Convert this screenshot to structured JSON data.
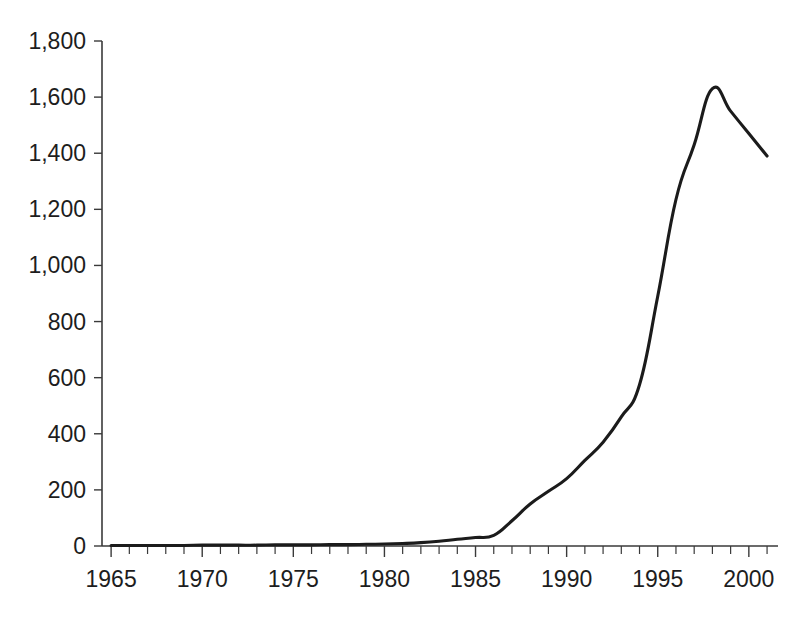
{
  "chart_data": {
    "type": "line",
    "title": "",
    "subtitle": "",
    "xlabel": "",
    "ylabel": "",
    "xlim": [
      1964.5,
      2001.6
    ],
    "ylim": [
      0,
      1800
    ],
    "grid": false,
    "legend": null,
    "legend_position": "none",
    "y_tick_labels": [
      "1,800",
      "1,600",
      "1,400",
      "1,200",
      "1,000",
      "800",
      "600",
      "400",
      "200",
      "0"
    ],
    "y_tick_values": [
      1800,
      1600,
      1400,
      1200,
      1000,
      800,
      600,
      400,
      200,
      0
    ],
    "y_tick_step": 200,
    "x_tick_labels": [
      "1965",
      "1970",
      "1975",
      "1980",
      "1985",
      "1990",
      "1995",
      "2000"
    ],
    "x_tick_values": [
      1965,
      1970,
      1975,
      1980,
      1985,
      1990,
      1995,
      2000
    ],
    "x_minor_tick_step": 1,
    "series": [
      {
        "name": "series-1",
        "color": "#1b1b1b",
        "x": [
          1965,
          1966,
          1967,
          1968,
          1969,
          1970,
          1971,
          1972,
          1973,
          1974,
          1975,
          1976,
          1977,
          1978,
          1979,
          1980,
          1981,
          1982,
          1983,
          1984,
          1985,
          1986,
          1987,
          1988,
          1989,
          1990,
          1991,
          1992,
          1993,
          1994,
          1995,
          1996,
          1997,
          1998,
          1999,
          2000,
          2001
        ],
        "values": [
          2,
          2,
          2,
          2,
          2,
          3,
          3,
          3,
          3,
          4,
          4,
          4,
          5,
          5,
          6,
          7,
          9,
          12,
          17,
          24,
          30,
          38,
          90,
          150,
          195,
          240,
          305,
          370,
          460,
          575,
          890,
          1235,
          1430,
          1630,
          1550,
          1470,
          1390
        ]
      }
    ]
  },
  "geometry": {
    "plot_left_px": 102,
    "plot_right_px": 778,
    "baseline_y_px": 546,
    "top_y_px": 41
  }
}
